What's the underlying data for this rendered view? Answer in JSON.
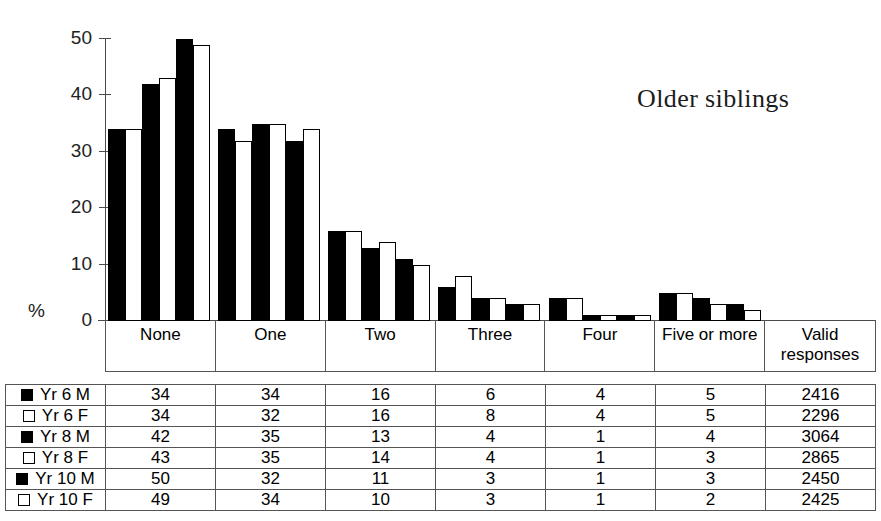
{
  "chart_data": {
    "type": "bar",
    "title": "Older siblings",
    "xlabel": "",
    "ylabel": "%",
    "ylim": [
      0,
      50
    ],
    "yticks": [
      0,
      10,
      20,
      30,
      40,
      50
    ],
    "grid": false,
    "legend_position": "table-left-column",
    "categories": [
      "None",
      "One",
      "Two",
      "Three",
      "Four",
      "Five or more"
    ],
    "series": [
      {
        "name": "Yr 6 M",
        "fill": "black",
        "values": [
          34,
          34,
          16,
          6,
          4,
          5
        ],
        "valid_responses": 2416
      },
      {
        "name": "Yr 6 F",
        "fill": "white",
        "values": [
          34,
          32,
          16,
          8,
          4,
          5
        ],
        "valid_responses": 2296
      },
      {
        "name": "Yr 8 M",
        "fill": "black",
        "values": [
          42,
          35,
          13,
          4,
          1,
          4
        ],
        "valid_responses": 3064
      },
      {
        "name": "Yr 8 F",
        "fill": "white",
        "values": [
          43,
          35,
          14,
          4,
          1,
          3
        ],
        "valid_responses": 2865
      },
      {
        "name": "Yr 10 M",
        "fill": "black",
        "values": [
          50,
          32,
          11,
          3,
          1,
          3
        ],
        "valid_responses": 2450
      },
      {
        "name": "Yr 10 F",
        "fill": "white",
        "values": [
          49,
          34,
          10,
          3,
          1,
          2
        ],
        "valid_responses": 2425
      }
    ]
  },
  "axis": {
    "y_tick_labels": [
      "50",
      "40",
      "30",
      "20",
      "10",
      "0"
    ],
    "percent_label": "%"
  },
  "table": {
    "valid_responses_header_line1": "Valid",
    "valid_responses_header_line2": "responses",
    "category_labels": [
      "None",
      "One",
      "Two",
      "Three",
      "Four",
      "Five or more"
    ],
    "rows": [
      {
        "series": "Yr 6 M",
        "swatch": "filled-square-icon",
        "cells": [
          "34",
          "34",
          "16",
          "6",
          "4",
          "5",
          "2416"
        ]
      },
      {
        "series": "Yr 6 F",
        "swatch": "outlined-square-icon",
        "cells": [
          "34",
          "32",
          "16",
          "8",
          "4",
          "5",
          "2296"
        ]
      },
      {
        "series": "Yr 8 M",
        "swatch": "filled-square-icon",
        "cells": [
          "42",
          "35",
          "13",
          "4",
          "1",
          "4",
          "3064"
        ]
      },
      {
        "series": "Yr 8 F",
        "swatch": "outlined-square-icon",
        "cells": [
          "43",
          "35",
          "14",
          "4",
          "1",
          "3",
          "2865"
        ]
      },
      {
        "series": "Yr 10 M",
        "swatch": "filled-square-icon",
        "cells": [
          "50",
          "32",
          "11",
          "3",
          "1",
          "3",
          "2450"
        ]
      },
      {
        "series": "Yr 10 F",
        "swatch": "outlined-square-icon",
        "cells": [
          "49",
          "34",
          "10",
          "3",
          "1",
          "2",
          "2425"
        ]
      }
    ]
  },
  "colors": {
    "male_fill": "#000000",
    "female_fill": "#ffffff",
    "stroke": "#000000",
    "grid_line": "#555555",
    "axis_line": "#4a4a4a"
  }
}
